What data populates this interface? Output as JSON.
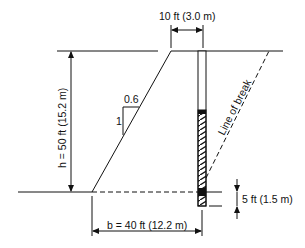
{
  "diagram": {
    "type": "dam-cross-section",
    "labels": {
      "crest_width": "10 ft (3.0 m)",
      "height": "h = 50 ft (15.2 m)",
      "base": "b = 40 ft (12.2 m)",
      "embedment": "5 ft (1.5 m)",
      "slope_horizontal": "0.6",
      "slope_vertical": "1",
      "line_of_break": "Line of break"
    },
    "colors": {
      "line": "#111111",
      "background": "#ffffff"
    }
  }
}
